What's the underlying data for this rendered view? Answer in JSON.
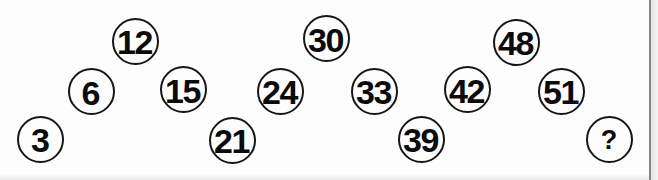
{
  "puzzle": {
    "type": "number-sequence-circles",
    "circles": [
      {
        "value": "3",
        "row": "bottom"
      },
      {
        "value": "6",
        "row": "middle"
      },
      {
        "value": "12",
        "row": "top"
      },
      {
        "value": "15",
        "row": "middle"
      },
      {
        "value": "21",
        "row": "bottom"
      },
      {
        "value": "24",
        "row": "middle"
      },
      {
        "value": "30",
        "row": "top"
      },
      {
        "value": "33",
        "row": "middle"
      },
      {
        "value": "39",
        "row": "bottom"
      },
      {
        "value": "42",
        "row": "middle"
      },
      {
        "value": "48",
        "row": "top"
      },
      {
        "value": "51",
        "row": "middle"
      },
      {
        "value": "?",
        "row": "bottom"
      }
    ],
    "colors": {
      "ink": "#161616",
      "digit": "#0b0b0b",
      "background": "#fdfdfd",
      "page_edge_line": "#868686",
      "page_edge_fill": "#e4e4e4"
    }
  }
}
